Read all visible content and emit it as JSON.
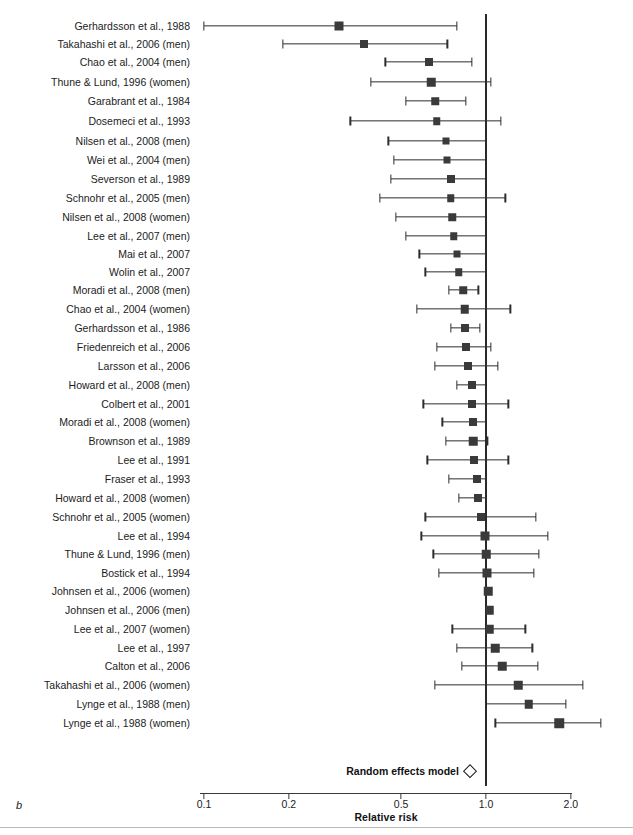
{
  "figure": {
    "panel_letter": "b",
    "axis_title": "Relative risk",
    "summary_label": "Random effects model",
    "scale": "log10",
    "reference_line": 1.0
  },
  "chart_data": {
    "type": "forest",
    "title": "",
    "xlabel": "Relative risk",
    "ylabel": "",
    "xscale": "log",
    "xlim": [
      0.1,
      2.0
    ],
    "tick_values": [
      0.1,
      0.2,
      0.5,
      1.0,
      2.0
    ],
    "tick_labels": [
      "0.1",
      "0.2",
      "0.5",
      "1.0",
      "2.0"
    ],
    "grid": false,
    "legend": "none",
    "reference_line": 1.0,
    "effect_measure": "Relative risk",
    "categories": [
      "Gerhardsson et al., 1988",
      "Takahashi et al., 2006 (men)",
      "Chao et al., 2004 (men)",
      "Thune & Lund, 1996 (women)",
      "Garabrant et al., 1984",
      "Dosemeci et al., 1993",
      "Nilsen et al., 2008 (men)",
      "Wei et al., 2004 (men)",
      "Severson et al., 1989",
      "Schnohr et al., 2005 (men)",
      "Nilsen et al., 2008 (women)",
      "Lee et al., 2007 (men)",
      "Mai et al., 2007",
      "Wolin et al., 2007",
      "Moradi et al., 2008 (men)",
      "Chao et al., 2004 (women)",
      "Gerhardsson et al., 1986",
      "Friedenreich et al., 2006",
      "Larsson et al., 2006",
      "Howard et al., 2008 (men)",
      "Colbert et al., 2001",
      "Moradi et al., 2008 (women)",
      "Brownson et al., 1989",
      "Lee et al., 1991",
      "Fraser et al., 1993",
      "Howard et al., 2008 (women)",
      "Schnohr et al., 2005 (women)",
      "Lee et al., 1994",
      "Thune & Lund, 1996 (men)",
      "Bostick et al., 1994",
      "Johnsen et al., 2006 (women)",
      "Johnsen et al., 2006 (men)",
      "Lee et al., 2007 (women)",
      "Lee et al., 1997",
      "Calton et al., 2006",
      "Takahashi et al., 2006 (women)",
      "Lynge et al., 1988 (men)",
      "Lynge et al., 1988 (women)"
    ],
    "studies": [
      {
        "label": "Gerhardsson et al., 1988",
        "rr": 0.3,
        "ci_low": 0.1,
        "ci_high": 0.79,
        "marker": 9.0,
        "y": 26
      },
      {
        "label": "Takahashi et al., 2006 (men)",
        "rr": 0.37,
        "ci_low": 0.19,
        "ci_high": 0.73,
        "marker": 8.0,
        "y": 44
      },
      {
        "label": "Chao et al., 2004 (men)",
        "rr": 0.63,
        "ci_low": 0.44,
        "ci_high": 0.89,
        "marker": 8.0,
        "y": 62
      },
      {
        "label": "Thune & Lund, 1996 (women)",
        "rr": 0.64,
        "ci_low": 0.39,
        "ci_high": 1.04,
        "marker": 8.5,
        "y": 82
      },
      {
        "label": "Garabrant et al., 1984",
        "rr": 0.66,
        "ci_low": 0.52,
        "ci_high": 0.85,
        "marker": 7.5,
        "y": 101
      },
      {
        "label": "Dosemeci et al., 1993",
        "rr": 0.67,
        "ci_low": 0.33,
        "ci_high": 1.13,
        "marker": 7.5,
        "y": 121
      },
      {
        "label": "Nilsen et al., 2008 (men)",
        "rr": 0.72,
        "ci_low": 0.45,
        "ci_high": 1.0,
        "marker": 7.0,
        "y": 141
      },
      {
        "label": "Wei et al., 2004 (men)",
        "rr": 0.73,
        "ci_low": 0.47,
        "ci_high": 1.0,
        "marker": 7.0,
        "y": 160
      },
      {
        "label": "Severson et al., 1989",
        "rr": 0.75,
        "ci_low": 0.46,
        "ci_high": 1.0,
        "marker": 8.0,
        "y": 179
      },
      {
        "label": "Schnohr et al., 2005 (men)",
        "rr": 0.75,
        "ci_low": 0.42,
        "ci_high": 1.17,
        "marker": 7.5,
        "y": 198
      },
      {
        "label": "Nilsen et al., 2008 (women)",
        "rr": 0.76,
        "ci_low": 0.48,
        "ci_high": 1.0,
        "marker": 7.5,
        "y": 217
      },
      {
        "label": "Lee et al., 2007 (men)",
        "rr": 0.77,
        "ci_low": 0.52,
        "ci_high": 1.0,
        "marker": 7.5,
        "y": 236
      },
      {
        "label": "Mai et al., 2007",
        "rr": 0.79,
        "ci_low": 0.58,
        "ci_high": 1.0,
        "marker": 7.0,
        "y": 254
      },
      {
        "label": "Wolin et al., 2007",
        "rr": 0.8,
        "ci_low": 0.61,
        "ci_high": 1.0,
        "marker": 7.5,
        "y": 272
      },
      {
        "label": "Moradi et al., 2008 (men)",
        "rr": 0.83,
        "ci_low": 0.74,
        "ci_high": 0.94,
        "marker": 7.5,
        "y": 290
      },
      {
        "label": "Chao et al., 2004 (women)",
        "rr": 0.84,
        "ci_low": 0.57,
        "ci_high": 1.22,
        "marker": 8.5,
        "y": 309
      },
      {
        "label": "Gerhardsson et al., 1986",
        "rr": 0.84,
        "ci_low": 0.75,
        "ci_high": 0.95,
        "marker": 8.0,
        "y": 328
      },
      {
        "label": "Friedenreich et al., 2006",
        "rr": 0.85,
        "ci_low": 0.67,
        "ci_high": 1.04,
        "marker": 8.0,
        "y": 347
      },
      {
        "label": "Larsson et al., 2006",
        "rr": 0.86,
        "ci_low": 0.66,
        "ci_high": 1.1,
        "marker": 8.0,
        "y": 366
      },
      {
        "label": "Howard et al., 2008 (men)",
        "rr": 0.89,
        "ci_low": 0.79,
        "ci_high": 1.0,
        "marker": 8.0,
        "y": 385
      },
      {
        "label": "Colbert et al., 2001",
        "rr": 0.89,
        "ci_low": 0.6,
        "ci_high": 1.2,
        "marker": 8.0,
        "y": 404
      },
      {
        "label": "Moradi et al., 2008 (women)",
        "rr": 0.9,
        "ci_low": 0.7,
        "ci_high": 1.0,
        "marker": 8.0,
        "y": 422
      },
      {
        "label": "Brownson et al., 1989",
        "rr": 0.9,
        "ci_low": 0.72,
        "ci_high": 1.01,
        "marker": 8.5,
        "y": 441
      },
      {
        "label": "Lee et al., 1991",
        "rr": 0.91,
        "ci_low": 0.62,
        "ci_high": 1.2,
        "marker": 8.0,
        "y": 460
      },
      {
        "label": "Fraser et al., 1993",
        "rr": 0.93,
        "ci_low": 0.74,
        "ci_high": 1.0,
        "marker": 8.0,
        "y": 479
      },
      {
        "label": "Howard et al., 2008 (women)",
        "rr": 0.94,
        "ci_low": 0.8,
        "ci_high": 1.0,
        "marker": 8.0,
        "y": 498
      },
      {
        "label": "Schnohr et al., 2005 (women)",
        "rr": 0.96,
        "ci_low": 0.61,
        "ci_high": 1.5,
        "marker": 8.0,
        "y": 517
      },
      {
        "label": "Lee et al., 1994",
        "rr": 0.99,
        "ci_low": 0.59,
        "ci_high": 1.66,
        "marker": 9.0,
        "y": 536
      },
      {
        "label": "Thune & Lund, 1996 (men)",
        "rr": 1.0,
        "ci_low": 0.65,
        "ci_high": 1.54,
        "marker": 8.5,
        "y": 554
      },
      {
        "label": "Bostick et al., 1994",
        "rr": 1.01,
        "ci_low": 0.68,
        "ci_high": 1.48,
        "marker": 9.0,
        "y": 573
      },
      {
        "label": "Johnsen et al., 2006 (women)",
        "rr": 1.02,
        "ci_low": 1.02,
        "ci_high": 1.02,
        "marker": 8.5,
        "y": 591
      },
      {
        "label": "Johnsen et al., 2006 (men)",
        "rr": 1.03,
        "ci_low": 1.03,
        "ci_high": 1.03,
        "marker": 8.5,
        "y": 610
      },
      {
        "label": "Lee et al., 2007 (women)",
        "rr": 1.03,
        "ci_low": 0.76,
        "ci_high": 1.38,
        "marker": 8.5,
        "y": 629
      },
      {
        "label": "Lee et al., 1997",
        "rr": 1.08,
        "ci_low": 0.79,
        "ci_high": 1.46,
        "marker": 8.5,
        "y": 648
      },
      {
        "label": "Calton et al., 2006",
        "rr": 1.14,
        "ci_low": 0.82,
        "ci_high": 1.53,
        "marker": 8.5,
        "y": 666
      },
      {
        "label": "Takahashi et al., 2006 (women)",
        "rr": 1.3,
        "ci_low": 0.66,
        "ci_high": 2.2,
        "marker": 8.5,
        "y": 685
      },
      {
        "label": "Lynge et al., 1988 (men)",
        "rr": 1.42,
        "ci_low": 1.0,
        "ci_high": 1.92,
        "marker": 8.5,
        "y": 704
      },
      {
        "label": "Lynge et al., 1988 (women)",
        "rr": 1.82,
        "ci_low": 1.08,
        "ci_high": 2.55,
        "marker": 9.5,
        "y": 723
      }
    ],
    "summary": {
      "label": "Random effects model",
      "rr": 0.88,
      "ci_low": 0.86,
      "ci_high": 0.91,
      "y": 771
    }
  }
}
